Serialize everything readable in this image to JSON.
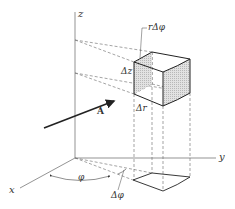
{
  "figure": {
    "axes": {
      "x_label": "x",
      "y_label": "y",
      "z_label": "z"
    },
    "labels": {
      "r_dphi": "rΔφ",
      "dz": "Δz",
      "dr": "Δr",
      "phi": "φ",
      "dphi": "Δφ",
      "vector": "A"
    },
    "colors": {
      "line": "#333333",
      "shade": "#d8d8d8",
      "dashed": "#555555"
    }
  }
}
